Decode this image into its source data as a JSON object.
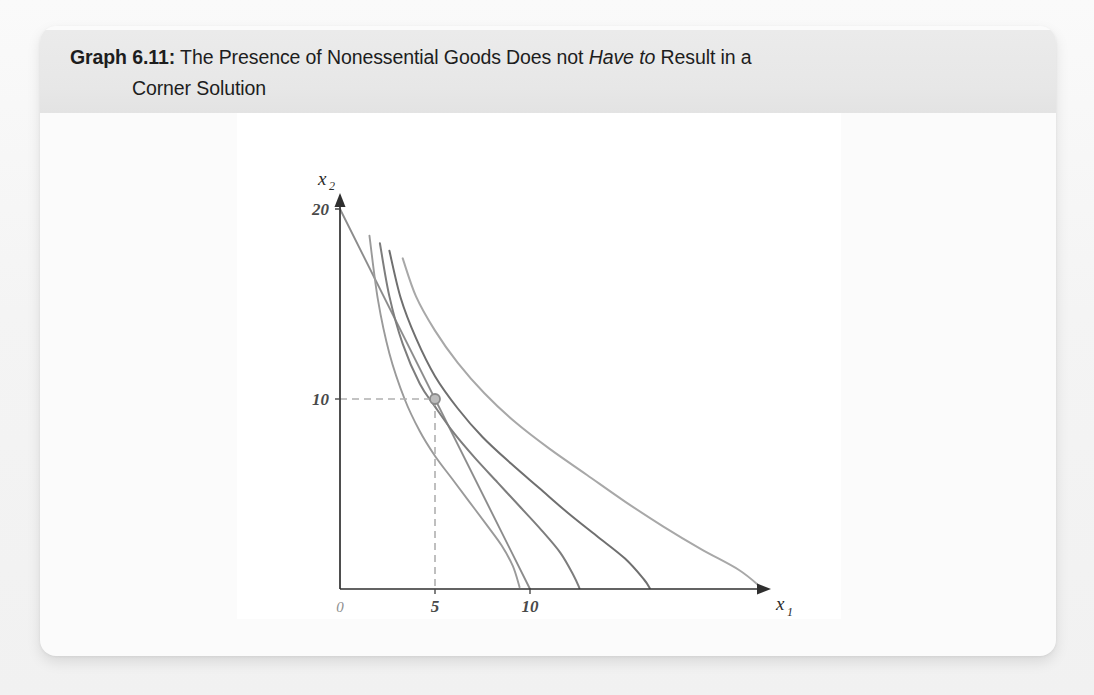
{
  "figure": {
    "caption_label": "Graph 6.11:",
    "caption_line1_a": " The Presence of Nonessential Goods Does not ",
    "caption_line1_italic": "Have to",
    "caption_line1_b": " Result in a",
    "caption_line2": "Corner Solution"
  },
  "chart_data": {
    "type": "line",
    "title": "The Presence of Nonessential Goods Does not Have to Result in a Corner Solution",
    "xlabel": "x1",
    "ylabel": "x2",
    "xlabel_base": "x",
    "xlabel_sub": "1",
    "ylabel_base": "x",
    "ylabel_sub": "2",
    "xlim": [
      0,
      27
    ],
    "ylim": [
      0,
      21.5
    ],
    "grid": false,
    "legend": false,
    "x_ticks": [
      {
        "value": 0,
        "label": "0"
      },
      {
        "value": 5,
        "label": "5"
      },
      {
        "value": 10,
        "label": "10"
      }
    ],
    "y_ticks": [
      {
        "value": 10,
        "label": "10"
      },
      {
        "value": 20,
        "label": "20"
      }
    ],
    "series": [
      {
        "name": "budget-line",
        "kind": "straight",
        "color": "#8c8c8c",
        "width": 1.9,
        "points": [
          [
            0,
            20
          ],
          [
            10,
            0
          ]
        ]
      },
      {
        "name": "indifference-curve-1",
        "kind": "hyperbola",
        "color": "#9a9a9a",
        "width": 1.9,
        "x_intercept": 9.5,
        "y_start": 18.6,
        "points": [
          [
            1.55,
            18.6
          ],
          [
            2,
            15.2
          ],
          [
            2.6,
            12.4
          ],
          [
            3.4,
            10.0
          ],
          [
            4.2,
            8.3
          ],
          [
            5.0,
            7.0
          ],
          [
            5.9,
            5.8
          ],
          [
            6.8,
            4.6
          ],
          [
            7.7,
            3.4
          ],
          [
            8.5,
            2.3
          ],
          [
            9.1,
            1.2
          ],
          [
            9.45,
            0.1
          ]
        ]
      },
      {
        "name": "indifference-curve-2",
        "kind": "hyperbola",
        "color": "#7d7d7d",
        "width": 2.0,
        "x_intercept": 12.6,
        "y_start": 18.2,
        "points": [
          [
            2.1,
            18.2
          ],
          [
            2.6,
            15.4
          ],
          [
            3.3,
            12.9
          ],
          [
            4.2,
            10.8
          ],
          [
            5.0,
            9.6
          ],
          [
            6.0,
            8.2
          ],
          [
            7.1,
            6.9
          ],
          [
            8.3,
            5.6
          ],
          [
            9.5,
            4.3
          ],
          [
            10.6,
            3.1
          ],
          [
            11.6,
            1.9
          ],
          [
            12.3,
            0.7
          ],
          [
            12.6,
            0.05
          ]
        ]
      },
      {
        "name": "indifference-curve-3",
        "kind": "hyperbola",
        "color": "#6f6f6f",
        "width": 2.0,
        "x_intercept": 16.3,
        "y_start": 17.8,
        "points": [
          [
            2.6,
            17.8
          ],
          [
            3.2,
            15.3
          ],
          [
            4.0,
            13.2
          ],
          [
            5.0,
            11.2
          ],
          [
            6.2,
            9.5
          ],
          [
            7.5,
            8.0
          ],
          [
            9.0,
            6.6
          ],
          [
            10.5,
            5.3
          ],
          [
            12.0,
            4.0
          ],
          [
            13.5,
            2.8
          ],
          [
            15.0,
            1.6
          ],
          [
            16.0,
            0.5
          ],
          [
            16.3,
            0.05
          ]
        ]
      },
      {
        "name": "indifference-curve-4",
        "kind": "hyperbola",
        "color": "#a8a8a8",
        "width": 2.0,
        "x_intercept": 22.2,
        "y_start": 17.4,
        "points": [
          [
            3.3,
            17.4
          ],
          [
            4.0,
            15.4
          ],
          [
            5.0,
            13.6
          ],
          [
            6.2,
            11.9
          ],
          [
            7.6,
            10.3
          ],
          [
            9.2,
            8.8
          ],
          [
            11.0,
            7.4
          ],
          [
            13.0,
            6.0
          ],
          [
            15.0,
            4.6
          ],
          [
            17.0,
            3.3
          ],
          [
            19.0,
            2.1
          ],
          [
            21.0,
            1.0
          ],
          [
            22.2,
            0.05
          ]
        ]
      }
    ],
    "annotations": [
      {
        "name": "optimal-bundle",
        "kind": "point-marker",
        "x": 5,
        "y": 10,
        "marker_color": "#8a8a8a",
        "guide_color": "#b0b0b0",
        "guide_style": "dashed"
      }
    ]
  }
}
